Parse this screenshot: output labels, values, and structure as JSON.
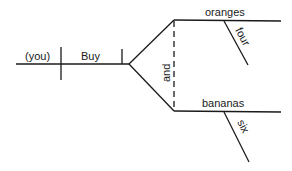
{
  "diagram": {
    "type": "sentence-diagram",
    "subject": "(you)",
    "verb": "Buy",
    "conjunction": "and",
    "objects": [
      {
        "word": "oranges",
        "modifier": "four"
      },
      {
        "word": "bananas",
        "modifier": "six"
      }
    ],
    "colors": {
      "line": "#1a1a1a",
      "background": "#ffffff"
    }
  }
}
